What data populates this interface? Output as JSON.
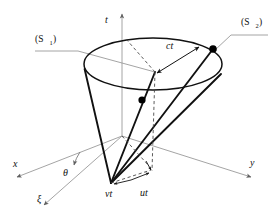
{
  "figure": {
    "type": "light-cone-diagram",
    "background_color": "#ffffff",
    "stroke_dark": "#111111",
    "stroke_light": "#9a9a9a",
    "dot_color": "#000000"
  },
  "labels": {
    "time_axis": "t",
    "x_axis": "x",
    "y_axis": "y",
    "xi_axis": "ξ",
    "angle": "θ",
    "radius": "ct",
    "v_displacement": "vt",
    "u_displacement": "ut",
    "frame_1_open": "(S",
    "frame_1_sub": "1",
    "frame_1_close": ")",
    "frame_2_open": "(S",
    "frame_2_sub": "2",
    "frame_2_close": ")"
  },
  "geometry": {
    "ellipse_center": [
      153,
      64
    ],
    "ellipse_rx": 69,
    "ellipse_ry": 26,
    "cone_apex": [
      111,
      183
    ],
    "origin": [
      122,
      136
    ],
    "cone_center_top": [
      155,
      72
    ],
    "event_point_1": [
      142,
      100
    ],
    "event_point_2": [
      213,
      49
    ],
    "ut_point": [
      151,
      172
    ]
  }
}
